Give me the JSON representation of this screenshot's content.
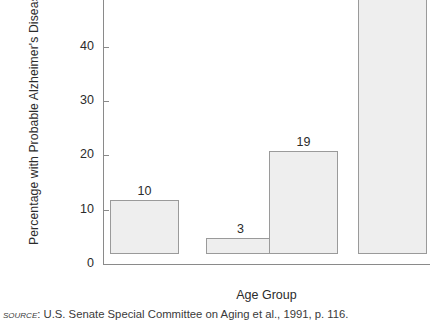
{
  "chart_data": {
    "type": "bar",
    "title": "",
    "categories": [
      "65+",
      "65–74",
      "75–84",
      "85+"
    ],
    "values": [
      10,
      3,
      19,
      47
    ],
    "value_labels": [
      "10",
      "3",
      "19",
      "47"
    ],
    "xlabel": "Age Group",
    "ylabel": "Percentage with Probable Alzheimer's Disease",
    "ylim": [
      0,
      48.6
    ],
    "yticks": [
      0,
      10,
      20,
      30,
      40
    ],
    "ytick_labels": [
      "0",
      "10",
      "20",
      "30",
      "40"
    ],
    "grid": false,
    "legend": null,
    "bar_fill": "#eeeeee",
    "bar_stroke": "#9a9a9a",
    "axis_color": "#8a8a8a"
  },
  "source": {
    "label": "Source",
    "separator": ":",
    "text": "U.S. Senate Special Committee on Aging et al., 1991, p. 116."
  }
}
